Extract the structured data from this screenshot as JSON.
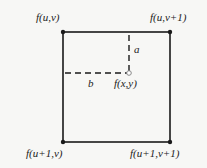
{
  "diagram": {
    "corners": {
      "top_left": "f(u,v)",
      "top_right": "f(u,v+1)",
      "bottom_left": "f(u+1,v)",
      "bottom_right": "f(u+1,v+1)"
    },
    "point": "f(x,y)",
    "distance_a": "a",
    "distance_b": "b",
    "colors": {
      "line": "#1a1a1a",
      "background": "#f7f7f5",
      "point": "#888888"
    }
  }
}
